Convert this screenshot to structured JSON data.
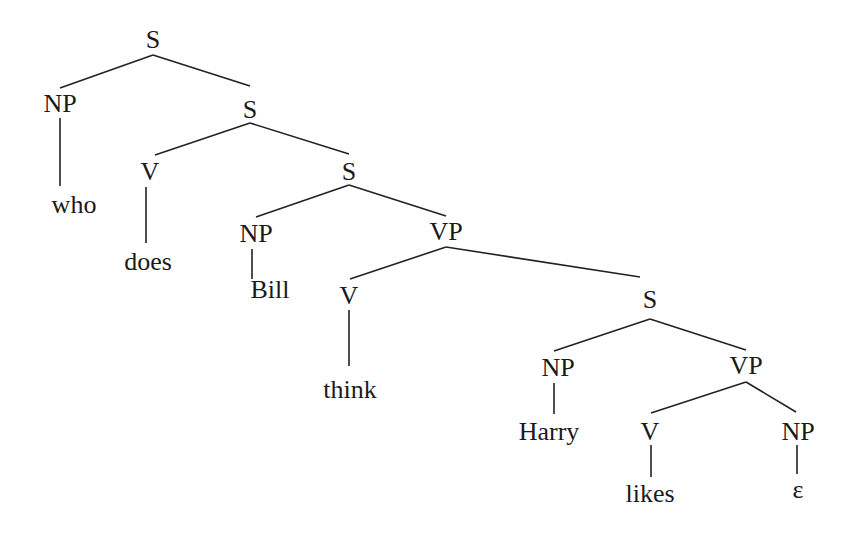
{
  "diagram": {
    "type": "syntax-tree",
    "nodes": [
      {
        "id": "s1",
        "label": "S",
        "x": 153,
        "y": 40
      },
      {
        "id": "np1",
        "label": "NP",
        "x": 60,
        "y": 104
      },
      {
        "id": "who",
        "label": "who",
        "x": 74,
        "y": 205
      },
      {
        "id": "s2",
        "label": "S",
        "x": 250,
        "y": 110
      },
      {
        "id": "v1",
        "label": "V",
        "x": 150,
        "y": 172
      },
      {
        "id": "does",
        "label": "does",
        "x": 148,
        "y": 262
      },
      {
        "id": "s3",
        "label": "S",
        "x": 349,
        "y": 172
      },
      {
        "id": "np2",
        "label": "NP",
        "x": 256,
        "y": 234
      },
      {
        "id": "bill",
        "label": "Bill",
        "x": 270,
        "y": 290
      },
      {
        "id": "vp1",
        "label": "VP",
        "x": 446,
        "y": 232
      },
      {
        "id": "v2",
        "label": "V",
        "x": 349,
        "y": 296
      },
      {
        "id": "think",
        "label": "think",
        "x": 350,
        "y": 390
      },
      {
        "id": "s4",
        "label": "S",
        "x": 650,
        "y": 300
      },
      {
        "id": "np3",
        "label": "NP",
        "x": 558,
        "y": 368
      },
      {
        "id": "harry",
        "label": "Harry",
        "x": 549,
        "y": 432
      },
      {
        "id": "vp2",
        "label": "VP",
        "x": 746,
        "y": 366
      },
      {
        "id": "v3",
        "label": "V",
        "x": 650,
        "y": 432
      },
      {
        "id": "likes",
        "label": "likes",
        "x": 650,
        "y": 494
      },
      {
        "id": "np4",
        "label": "NP",
        "x": 798,
        "y": 432
      },
      {
        "id": "eps",
        "label": "ε",
        "x": 798,
        "y": 490
      }
    ],
    "edges": [
      {
        "x1": 153,
        "y1": 55,
        "x2": 60,
        "y2": 88
      },
      {
        "x1": 153,
        "y1": 55,
        "x2": 250,
        "y2": 86
      },
      {
        "x1": 60,
        "y1": 118,
        "x2": 60,
        "y2": 186
      },
      {
        "x1": 250,
        "y1": 123,
        "x2": 155,
        "y2": 155
      },
      {
        "x1": 250,
        "y1": 123,
        "x2": 349,
        "y2": 154
      },
      {
        "x1": 146,
        "y1": 187,
        "x2": 146,
        "y2": 243
      },
      {
        "x1": 349,
        "y1": 185,
        "x2": 256,
        "y2": 217
      },
      {
        "x1": 349,
        "y1": 185,
        "x2": 446,
        "y2": 216
      },
      {
        "x1": 252,
        "y1": 249,
        "x2": 252,
        "y2": 279
      },
      {
        "x1": 446,
        "y1": 247,
        "x2": 350,
        "y2": 279
      },
      {
        "x1": 446,
        "y1": 247,
        "x2": 640,
        "y2": 277
      },
      {
        "x1": 349,
        "y1": 310,
        "x2": 349,
        "y2": 366
      },
      {
        "x1": 650,
        "y1": 319,
        "x2": 554,
        "y2": 351
      },
      {
        "x1": 650,
        "y1": 319,
        "x2": 746,
        "y2": 350
      },
      {
        "x1": 554,
        "y1": 383,
        "x2": 554,
        "y2": 414
      },
      {
        "x1": 746,
        "y1": 382,
        "x2": 651,
        "y2": 413
      },
      {
        "x1": 746,
        "y1": 382,
        "x2": 796,
        "y2": 412
      },
      {
        "x1": 651,
        "y1": 445,
        "x2": 651,
        "y2": 477
      },
      {
        "x1": 797,
        "y1": 445,
        "x2": 797,
        "y2": 474
      }
    ]
  }
}
